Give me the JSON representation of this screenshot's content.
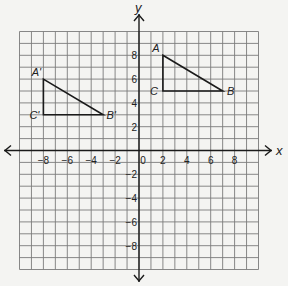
{
  "axes": {
    "x_label": "x",
    "y_label": "y",
    "range": {
      "x": [
        -10,
        10
      ],
      "y": [
        -10,
        10
      ]
    },
    "x_ticks": [
      {
        "value": -8,
        "label": "−8"
      },
      {
        "value": -6,
        "label": "−6"
      },
      {
        "value": -4,
        "label": "−4"
      },
      {
        "value": -2,
        "label": "−2"
      },
      {
        "value": 0,
        "label": "0"
      },
      {
        "value": 2,
        "label": "2"
      },
      {
        "value": 4,
        "label": "4"
      },
      {
        "value": 6,
        "label": "6"
      },
      {
        "value": 8,
        "label": "8"
      }
    ],
    "y_ticks": [
      {
        "value": 8,
        "label": "8"
      },
      {
        "value": 6,
        "label": "6"
      },
      {
        "value": 4,
        "label": "4"
      },
      {
        "value": 2,
        "label": "2"
      },
      {
        "value": -2,
        "label": "−2"
      },
      {
        "value": -4,
        "label": "−4"
      },
      {
        "value": -6,
        "label": "−6"
      },
      {
        "value": -8,
        "label": "−8"
      }
    ]
  },
  "triangles": [
    {
      "name": "ABC",
      "vertices": [
        {
          "label": "A",
          "x": 2,
          "y": 8
        },
        {
          "label": "B",
          "x": 7,
          "y": 5
        },
        {
          "label": "C",
          "x": 2,
          "y": 5
        }
      ]
    },
    {
      "name": "A'B'C'",
      "vertices": [
        {
          "label": "A'",
          "x": -8,
          "y": 6
        },
        {
          "label": "B'",
          "x": -3,
          "y": 3
        },
        {
          "label": "C'",
          "x": -8,
          "y": 3
        }
      ]
    }
  ],
  "colors": {
    "grid": "#7a7a7a",
    "axis": "#1a1a1a",
    "shape": "#1a1a1a",
    "background": "#f4f4f2"
  }
}
